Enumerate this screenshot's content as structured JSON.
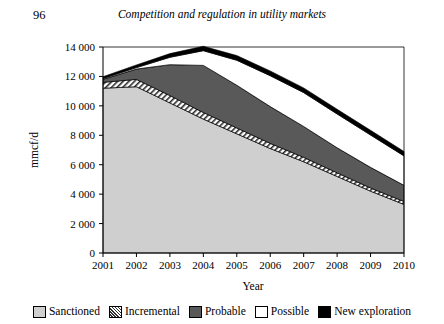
{
  "page": {
    "number": "96",
    "running_head": "Competition and regulation in utility markets"
  },
  "legend": {
    "items": [
      {
        "label": "Sanctioned",
        "swatch": "light-gray-square",
        "color": "#cfcfcf"
      },
      {
        "label": "Incremental",
        "swatch": "diagonal-hatch-square",
        "color": "#ffffff"
      },
      {
        "label": "Probable",
        "swatch": "dark-gray-square",
        "color": "#595959"
      },
      {
        "label": "Possible",
        "swatch": "white-square",
        "color": "#ffffff"
      },
      {
        "label": "New exploration",
        "swatch": "black-square",
        "color": "#000000"
      }
    ]
  },
  "chart_data": {
    "type": "area",
    "stacked": true,
    "title": "",
    "xlabel": "Year",
    "ylabel": "mmcf/d",
    "categories": [
      "2001",
      "2002",
      "2003",
      "2004",
      "2005",
      "2006",
      "2007",
      "2008",
      "2009",
      "2010"
    ],
    "x": [
      2001,
      2002,
      2003,
      2004,
      2005,
      2006,
      2007,
      2008,
      2009,
      2010
    ],
    "ylim": [
      0,
      14000
    ],
    "yticks": [
      0,
      2000,
      4000,
      6000,
      8000,
      10000,
      12000,
      14000
    ],
    "ytick_labels": [
      "0",
      "2 000",
      "4 000",
      "6 000",
      "8 000",
      "10 000",
      "12 000",
      "14 000"
    ],
    "grid": false,
    "legend_position": "bottom",
    "series": [
      {
        "name": "Sanctioned",
        "values": [
          11200,
          11300,
          10200,
          9100,
          8100,
          7100,
          6200,
          5200,
          4200,
          3300
        ]
      },
      {
        "name": "Incremental",
        "values": [
          400,
          500,
          500,
          450,
          400,
          350,
          300,
          250,
          220,
          200
        ]
      },
      {
        "name": "Probable",
        "values": [
          200,
          700,
          2100,
          3200,
          2900,
          2500,
          2100,
          1700,
          1400,
          1100
        ]
      },
      {
        "name": "Possible",
        "values": [
          60,
          100,
          500,
          1000,
          1700,
          2100,
          2300,
          2300,
          2200,
          2000
        ]
      },
      {
        "name": "New exploration",
        "values": [
          120,
          180,
          250,
          300,
          320,
          320,
          320,
          320,
          320,
          300
        ]
      }
    ],
    "cumulative_totals": [
      11980,
      12780,
      13550,
      14050,
      13420,
      12370,
      11220,
      9770,
      8340,
      6900
    ]
  }
}
